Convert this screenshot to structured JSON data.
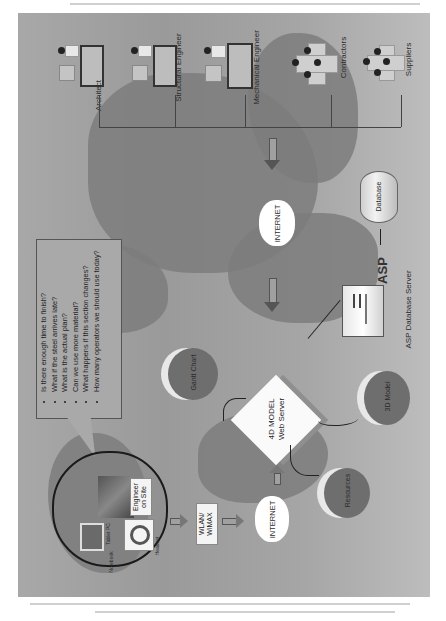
{
  "diagram": {
    "orientation": "rotated-90-ccw",
    "stakeholders": [
      {
        "label": "Architect"
      },
      {
        "label": "Structural Engineer"
      },
      {
        "label": "Mechanical Engineer"
      },
      {
        "label": "Contractors"
      },
      {
        "label": "Suppliers"
      }
    ],
    "internet_top": {
      "label": "INTERNET"
    },
    "internet_bottom": {
      "label": "INTERNET"
    },
    "database": {
      "label": "Database"
    },
    "asp_server": {
      "logo": "ASP",
      "label": "ASP Database Server"
    },
    "web_server": {
      "line1": "4D MODEL",
      "line2": "Web Server"
    },
    "outputs": [
      {
        "label": "Gantt Chart"
      },
      {
        "label": "3D Model"
      },
      {
        "label": "Resources"
      }
    ],
    "wireless": {
      "line1": "WLAN/",
      "line2": "WiMAX"
    },
    "site_cloud": {
      "engineer": {
        "line1": "Engineer",
        "line2": "on Site"
      },
      "devices": [
        {
          "label": "Tablet PC"
        },
        {
          "label": "Headset"
        },
        {
          "label": "Notebook"
        }
      ]
    },
    "questions": [
      "Is there enough time to finish?",
      "What if the steel arrives late?",
      "What is the actual plan?",
      "Can we use more material?",
      "What happens if this section changes?",
      "How many operators we should use today?"
    ]
  },
  "colors": {
    "background": "#a4a4a4",
    "land": "#7d7d7d",
    "circle": "#6e6e6e",
    "white": "#fafafa",
    "line": "#333333"
  }
}
